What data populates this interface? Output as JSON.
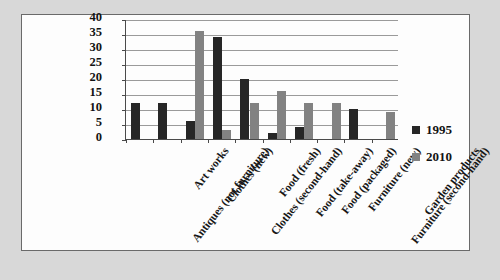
{
  "chart_data": {
    "type": "bar",
    "title": "",
    "xlabel": "",
    "ylabel": "",
    "ylim": [
      0,
      40
    ],
    "ytick_step": 5,
    "yticks": [
      40,
      35,
      30,
      25,
      20,
      15,
      10,
      5,
      0
    ],
    "grid": true,
    "legend_position": "right",
    "categories": [
      "Antiques (not furniture)",
      "Art works",
      "Clothes (new)",
      "Clothes (second-hand)",
      "Food (fresh)",
      "Food (take-away)",
      "Food (packaged)",
      "Furniture (new)",
      "Furniture (second-hand)",
      "Garden products"
    ],
    "series": [
      {
        "name": "1995",
        "color": "#262626",
        "values": [
          12,
          12,
          6,
          34,
          20,
          2,
          4,
          0,
          10,
          0
        ]
      },
      {
        "name": "2010",
        "color": "#828282",
        "values": [
          0,
          0,
          36,
          3,
          12,
          16,
          12,
          12,
          0,
          9
        ]
      }
    ]
  },
  "legend": {
    "entries": [
      {
        "label": "1995"
      },
      {
        "label": "2010"
      }
    ]
  },
  "colors": {
    "page_background": "#d8d8d8",
    "panel_background": "#fdfdfd",
    "panel_border": "#6a6a6a",
    "axis": "#4a4a4a",
    "gridline": "#9a9a9a",
    "series_1995": "#262626",
    "series_2010": "#828282"
  }
}
